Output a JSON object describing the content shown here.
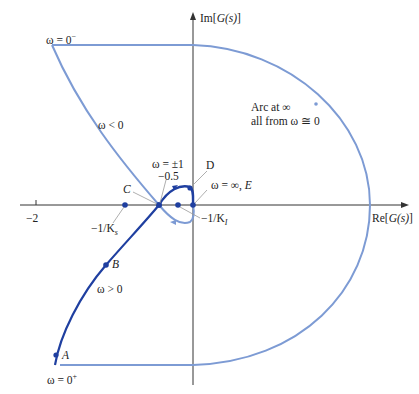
{
  "diagram": {
    "type": "nyquist-plot",
    "axes": {
      "real_label_prefix": "Re",
      "real_label_fn": "G(s)",
      "imag_label_prefix": "Im",
      "imag_label_fn": "G(s)",
      "tick_minus_two": "−2"
    },
    "labels": {
      "omega_zero_minus": "ω = 0",
      "omega_zero_minus_sup": "−",
      "omega_zero_plus": "ω = 0",
      "omega_zero_plus_sup": "+",
      "omega_negative": "ω < 0",
      "omega_positive": "ω > 0",
      "omega_pm_one": "ω = ±1",
      "minus_half": "−0.5",
      "point_c": "C",
      "point_d": "D",
      "point_b": "B",
      "point_a": "A",
      "omega_inf": "ω = ∞, ",
      "point_e": "E",
      "minus_inv_ks": "−1/K",
      "ks_sub": "s",
      "minus_inv_ki": "−1/K",
      "ki_sub": "I",
      "arc_line1": "Arc at ∞",
      "arc_line2": "all from ω ≅ 0"
    },
    "colors": {
      "positive_branch": "#1f3fa0",
      "negative_branch": "#7d9bd4",
      "axes": "#333333",
      "leader_lines": "#999999"
    },
    "points": [
      {
        "name": "A",
        "desc": "ω = 0+ start"
      },
      {
        "name": "B",
        "desc": "on ω > 0 branch"
      },
      {
        "name": "C",
        "desc": "real-axis crossing at −0.5, ω = ±1"
      },
      {
        "name": "D",
        "desc": "loop top near imaginary axis"
      },
      {
        "name": "E",
        "desc": "ω = ∞ at origin"
      },
      {
        "name": "-1/Ks",
        "desc": "critical point on real axis"
      },
      {
        "name": "-1/KI",
        "desc": "critical point on real axis"
      }
    ]
  }
}
